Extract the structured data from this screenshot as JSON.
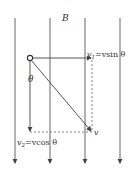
{
  "diagram": {
    "field_label": "B",
    "angle_label": "θ",
    "v1_label_prefix": "v",
    "v1_label_sub": "1",
    "v1_label_rest": "=vsin θ",
    "v2_label_prefix": "v",
    "v2_label_sub": "2",
    "v2_label_rest": "=vcos θ",
    "v_label": "v",
    "field_lines_count": 4,
    "colors": {
      "line": "#444444",
      "dashed": "#666666",
      "text": "#333333"
    }
  }
}
